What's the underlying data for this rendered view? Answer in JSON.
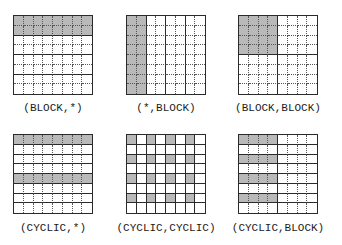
{
  "figure": {
    "grid_size": 8,
    "shade_color": "#b9b9b9",
    "line_color": "#2a2a2a",
    "panels": [
      {
        "id": "block-star",
        "label": "(BLOCK,*)",
        "distribution": "row-block",
        "shaded_rows": [
          0,
          1
        ],
        "shaded_cols": "all",
        "solid_row_lines": [
          2,
          4,
          6
        ],
        "solid_col_lines": []
      },
      {
        "id": "star-block",
        "label": "(*,BLOCK)",
        "distribution": "col-block",
        "shaded_rows": "all",
        "shaded_cols": [
          0,
          1
        ],
        "solid_row_lines": [],
        "solid_col_lines": [
          2,
          4,
          6
        ]
      },
      {
        "id": "block-block",
        "label": "(BLOCK,BLOCK)",
        "distribution": "2d-block",
        "shaded_rows": [
          0,
          1,
          2,
          3
        ],
        "shaded_cols": [
          0,
          1,
          2,
          3
        ],
        "solid_row_lines": [
          4
        ],
        "solid_col_lines": [
          4
        ]
      },
      {
        "id": "cyclic-star",
        "label": "(CYCLIC,*)",
        "distribution": "row-cyclic",
        "shaded_rows": [
          0,
          4
        ],
        "shaded_cols": "all",
        "solid_row_lines": [
          1,
          2,
          3,
          4,
          5,
          6,
          7
        ],
        "solid_col_lines": []
      },
      {
        "id": "cyclic-cyclic",
        "label": "(CYCLIC,CYCLIC)",
        "distribution": "2d-cyclic",
        "shaded_rows": [
          0,
          2,
          4,
          6
        ],
        "shaded_cols": [
          0,
          2,
          4,
          6
        ],
        "solid_row_lines": [
          1,
          2,
          3,
          4,
          5,
          6,
          7
        ],
        "solid_col_lines": [
          1,
          2,
          3,
          4,
          5,
          6,
          7
        ]
      },
      {
        "id": "cyclic-block",
        "label": "(CYCLIC,BLOCK)",
        "distribution": "cyclic-block",
        "shaded_rows": [
          0,
          2,
          4,
          6
        ],
        "shaded_cols": [
          0,
          1,
          2,
          3
        ],
        "solid_row_lines": [
          1,
          2,
          3,
          4,
          5,
          6,
          7
        ],
        "solid_col_lines": [
          4
        ]
      }
    ]
  }
}
